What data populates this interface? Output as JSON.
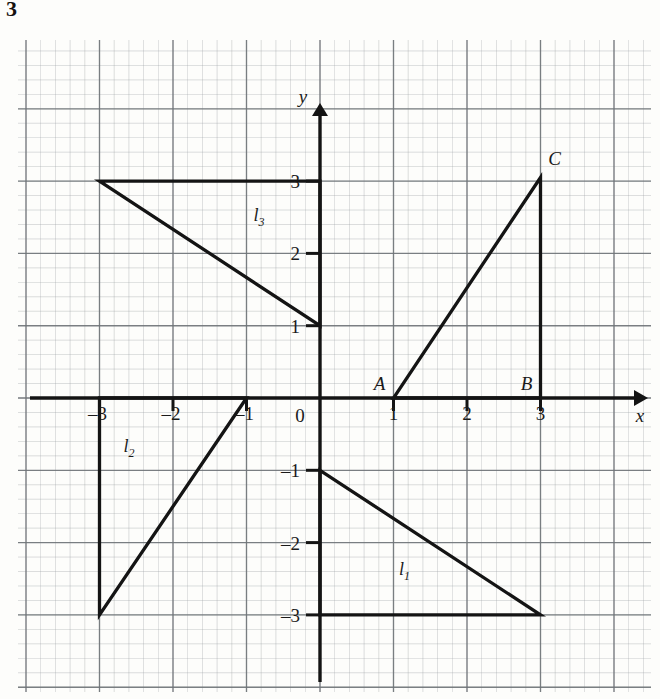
{
  "question_number": "3",
  "figure": {
    "type": "coordinate-grid-diagram",
    "axes": {
      "x_label": "x",
      "y_label": "y",
      "origin_label": "0",
      "x_ticks": [
        {
          "value": -3,
          "label": "–3"
        },
        {
          "value": -2,
          "label": "–2"
        },
        {
          "value": -1,
          "label": "–1"
        },
        {
          "value": 1,
          "label": "1"
        },
        {
          "value": 2,
          "label": "2"
        },
        {
          "value": 3,
          "label": "3"
        }
      ],
      "y_ticks": [
        {
          "value": 3,
          "label": "3"
        },
        {
          "value": 2,
          "label": "2"
        },
        {
          "value": 1,
          "label": "1"
        },
        {
          "value": -1,
          "label": "–1"
        },
        {
          "value": -2,
          "label": "–2"
        },
        {
          "value": -3,
          "label": "–3"
        }
      ],
      "x_range": [
        -4.1,
        4.3
      ],
      "y_range": [
        -4.0,
        4.1
      ]
    },
    "grid": {
      "major_step": 1,
      "minor_step": 0.2,
      "visible": true,
      "major_color": "#6f7478",
      "minor_color": "#9aa0a4"
    },
    "point_labels": [
      {
        "name": "A",
        "label": "A",
        "x": 1,
        "y": 0
      },
      {
        "name": "B",
        "label": "B",
        "x": 3,
        "y": 0
      },
      {
        "name": "C",
        "label": "C",
        "x": 3,
        "y": 3.05
      }
    ],
    "shapes": [
      {
        "name": "triangle-abc",
        "label": "",
        "vertices": [
          [
            1,
            0
          ],
          [
            3,
            0
          ],
          [
            3,
            3.05
          ]
        ]
      },
      {
        "name": "triangle-l1",
        "label": "l",
        "sub": "1",
        "label_x": 1.15,
        "label_y": -2.45,
        "vertices": [
          [
            0,
            -1
          ],
          [
            3,
            -3
          ],
          [
            0,
            -3
          ]
        ]
      },
      {
        "name": "triangle-l2",
        "label": "l",
        "sub": "2",
        "label_x": -2.6,
        "label_y": -0.75,
        "vertices": [
          [
            -1,
            0
          ],
          [
            -3,
            -3
          ],
          [
            -3,
            0
          ]
        ]
      },
      {
        "name": "triangle-l3",
        "label": "l",
        "sub": "3",
        "label_x": -0.83,
        "label_y": 2.45,
        "vertices": [
          [
            -3,
            3
          ],
          [
            0,
            3
          ],
          [
            0,
            1
          ]
        ]
      }
    ],
    "stroke_color": "#141414"
  }
}
